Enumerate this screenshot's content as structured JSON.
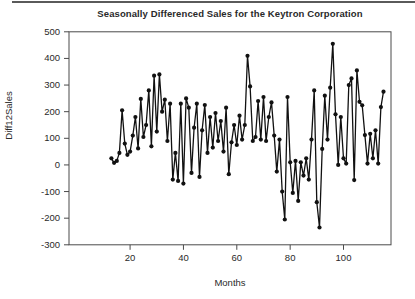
{
  "page": {
    "top_rule_color": "#5a5a5a",
    "background": "#ffffff"
  },
  "chart_data": {
    "type": "line",
    "title": "Seasonally Differenced Sales for the Keytron Corporation",
    "xlabel": "Months",
    "ylabel": "Diff12Sales",
    "x_first": 13,
    "x_last": 115,
    "values": [
      25,
      8,
      15,
      45,
      205,
      80,
      38,
      50,
      110,
      180,
      62,
      248,
      105,
      150,
      280,
      70,
      335,
      125,
      340,
      200,
      245,
      90,
      230,
      -55,
      45,
      -60,
      230,
      -70,
      250,
      215,
      -30,
      140,
      230,
      -45,
      130,
      225,
      45,
      180,
      65,
      195,
      90,
      165,
      50,
      215,
      -35,
      85,
      150,
      75,
      185,
      95,
      150,
      410,
      295,
      90,
      105,
      240,
      95,
      255,
      90,
      180,
      235,
      110,
      -25,
      95,
      -100,
      -205,
      255,
      10,
      -105,
      15,
      -135,
      10,
      -40,
      25,
      -55,
      95,
      280,
      -140,
      -235,
      60,
      260,
      95,
      290,
      455,
      190,
      0,
      180,
      25,
      5,
      300,
      325,
      -57,
      355,
      237,
      224,
      112,
      5,
      117,
      25,
      130,
      5,
      217,
      275
    ],
    "xticks": [
      20,
      40,
      60,
      80,
      100
    ],
    "yticks": [
      500,
      400,
      300,
      200,
      100,
      0,
      -100,
      -200,
      -300
    ],
    "xlim": [
      -2.9,
      117.8
    ],
    "ylim": [
      -300,
      500
    ],
    "grid": false,
    "legend": null,
    "marker": "filled-circle",
    "line_color": "#111111",
    "marker_color": "#111111",
    "frame_color": "#4a4a4a",
    "tick_color": "#4a4a4a",
    "text_color": "#2a2a2a"
  }
}
